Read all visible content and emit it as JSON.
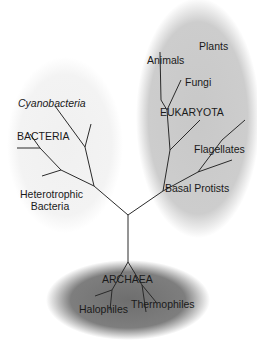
{
  "diagram": {
    "type": "phylogenetic-tree",
    "domains": [
      {
        "id": "bacteria",
        "label": "BACTERIA",
        "subgroups": [
          "Cyanobacteria",
          "Heterotrophic Bacteria"
        ]
      },
      {
        "id": "eukaryota",
        "label": "EUKARYOTA",
        "subgroups": [
          "Plants",
          "Animals",
          "Fungi",
          "Flagellates",
          "Basal Protists"
        ]
      },
      {
        "id": "archaea",
        "label": "ARCHAEA",
        "subgroups": [
          "Halophiles",
          "Thermophiles"
        ]
      }
    ],
    "colors": {
      "bacteria_region": "#f1f1f1",
      "eukaryota_region": "#c9c9c9",
      "archaea_region": "#7a7a7a",
      "branch": "#2a2a2a"
    }
  },
  "labels": {
    "cyanobacteria": "Cyanobacteria",
    "bacteria": "BACTERIA",
    "heterotrophic_line1": "Heterotrophic",
    "heterotrophic_line2": "Bacteria",
    "plants": "Plants",
    "animals": "Animals",
    "fungi": "Fungi",
    "eukaryota": "EUKARYOTA",
    "flagellates": "Flagellates",
    "basal_protists": "Basal Protists",
    "archaea": "ARCHAEA",
    "halophiles": "Halophiles",
    "thermophiles": "Thermophiles"
  }
}
